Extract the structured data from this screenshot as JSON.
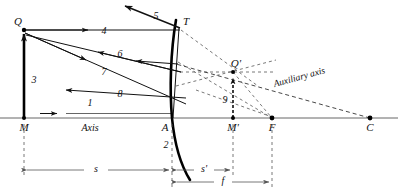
{
  "figure": {
    "kind": "ray-diagram",
    "background_color": "#ffffff",
    "ink_color": "#111111"
  },
  "points": [
    {
      "id": "Q",
      "label": "Q",
      "x": 24,
      "y": 30,
      "desc": "object tip"
    },
    {
      "id": "M",
      "label": "M",
      "x": 24,
      "y": 118,
      "desc": "object foot on axis"
    },
    {
      "id": "T",
      "label": "T",
      "x": 180,
      "y": 28,
      "desc": "ray strike point on mirror"
    },
    {
      "id": "A",
      "label": "A",
      "x": 172,
      "y": 118,
      "desc": "mirror vertex"
    },
    {
      "id": "Mp",
      "label": "M'",
      "x": 233,
      "y": 118,
      "desc": "image foot on axis"
    },
    {
      "id": "Qp",
      "label": "Q'",
      "x": 233,
      "y": 72,
      "desc": "image tip"
    },
    {
      "id": "F",
      "label": "F",
      "x": 272,
      "y": 118,
      "desc": "focal point"
    },
    {
      "id": "C",
      "label": "C",
      "x": 370,
      "y": 118,
      "desc": "center of curvature"
    }
  ],
  "ray_labels": [
    {
      "n": "1",
      "x": 90,
      "y": 106,
      "desc": "axis ray"
    },
    {
      "n": "2",
      "x": 166,
      "y": 148,
      "desc": "mirror surface"
    },
    {
      "n": "3",
      "x": 33,
      "y": 80,
      "desc": "object arrow"
    },
    {
      "n": "4",
      "x": 104,
      "y": 34,
      "desc": "incident parallel ray"
    },
    {
      "n": "5",
      "x": 155,
      "y": 16,
      "desc": "reflected ray leaving mirror"
    },
    {
      "n": "6",
      "x": 118,
      "y": 57,
      "desc": "reflected ray toward left"
    },
    {
      "n": "7",
      "x": 104,
      "y": 73,
      "desc": "incident ray to vertex"
    },
    {
      "n": "8",
      "x": 118,
      "y": 94,
      "desc": "reflected ray from vertex"
    },
    {
      "n": "9",
      "x": 224,
      "y": 101,
      "desc": "image arrow"
    }
  ],
  "text_labels": {
    "axis": "Axis",
    "auxiliary_axis": "Auxiliary axis"
  },
  "dimensions": [
    {
      "id": "s",
      "label": "s",
      "from": "M",
      "to": "A",
      "x1": 24,
      "x2": 172,
      "y": 170,
      "text_x": 96,
      "text_y": 167
    },
    {
      "id": "sp",
      "label": "s'",
      "from": "A",
      "to": "Mp",
      "x1": 174,
      "x2": 233,
      "y": 170,
      "text_x": 203,
      "text_y": 167
    },
    {
      "id": "f",
      "label": "f",
      "from": "A",
      "to": "F",
      "x1": 174,
      "x2": 272,
      "y": 182,
      "text_x": 222,
      "text_y": 179
    }
  ],
  "colors": {
    "ink": "#111111",
    "dash": "#333333",
    "dim": "#555555",
    "axis": "#666666",
    "mirror": "#000000",
    "background": "#ffffff"
  }
}
